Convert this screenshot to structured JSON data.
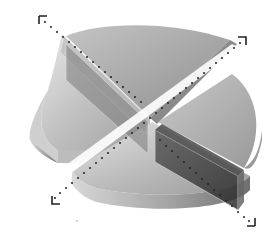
{
  "diagram": {
    "type": "exploded-3d-disc",
    "segments": 4,
    "arrows": [
      {
        "name": "arrow-top-left",
        "direction": "up-left"
      },
      {
        "name": "arrow-top-right",
        "direction": "up-right"
      },
      {
        "name": "arrow-bottom-left",
        "direction": "down-left"
      },
      {
        "name": "arrow-bottom-right",
        "direction": "down-right"
      }
    ],
    "colors": {
      "disc_light": "#d9d9d9",
      "disc_mid": "#b3b3b3",
      "disc_dark": "#7a7a7a",
      "slab_dark": "#3a3a3a",
      "dots": "#222222",
      "background": "#ffffff"
    }
  }
}
